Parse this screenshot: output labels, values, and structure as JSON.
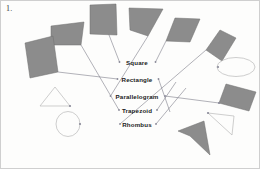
{
  "worksheet": {
    "question_number": "1.",
    "title_visible": false,
    "background_color": "#fdfdfc"
  },
  "palette": {
    "shape_fill": "#8c8c8c",
    "shape_stroke": "#6f6f6f",
    "outline_shape_stroke": "#b9b9b9",
    "connector_stroke": "#7e7e8a",
    "label_color": "#1b1b1b",
    "dot_color": "#8a8a99"
  },
  "labels": [
    {
      "id": "square",
      "text": "Square",
      "x": 137,
      "y": 62
    },
    {
      "id": "rectangle",
      "text": "Rectangle",
      "x": 137,
      "y": 79
    },
    {
      "id": "parallelogram",
      "text": "Parallelogram",
      "x": 137,
      "y": 96
    },
    {
      "id": "trapezoid",
      "text": "Trapezoid",
      "x": 137,
      "y": 110
    },
    {
      "id": "rhombus",
      "text": "Rhombus",
      "x": 137,
      "y": 124
    }
  ],
  "label_dots": [
    {
      "id": "square-left-dot",
      "x": 119.5,
      "y": 62
    },
    {
      "id": "square-right-dot",
      "x": 155.5,
      "y": 62
    },
    {
      "id": "rectangle-left-dot",
      "x": 117.5,
      "y": 79
    },
    {
      "id": "rectangle-right-dot",
      "x": 158.5,
      "y": 79
    },
    {
      "id": "parallelogram-left-dot",
      "x": 110.5,
      "y": 96
    },
    {
      "id": "parallelogram-right-dot",
      "x": 165.0,
      "y": 96
    },
    {
      "id": "trapezoid-left-dot",
      "x": 119.0,
      "y": 110
    },
    {
      "id": "trapezoid-right-dot",
      "x": 157.0,
      "y": 110
    },
    {
      "id": "rhombus-left-dot",
      "x": 120.0,
      "y": 124
    },
    {
      "id": "rhombus-right-dot",
      "x": 156.0,
      "y": 124
    }
  ],
  "filled_shapes": [
    {
      "id": "shape-square-top",
      "kind": "square",
      "points": "90,5 116,4 117,35 90,34"
    },
    {
      "id": "shape-trapezoid-topleft",
      "kind": "trapezoid",
      "points": "51,26 84,22 81,45 51,45"
    },
    {
      "id": "shape-rect-tilted-left",
      "kind": "rectangle",
      "points": "25,43 53,36 58,72 30,78"
    },
    {
      "id": "shape-trapezoid-topmid",
      "kind": "trapezoid",
      "points": "129,8 163,9 148,36 130,30"
    },
    {
      "id": "shape-parallelogram-top",
      "kind": "parallelogram",
      "points": "175,18 200,19 190,42 166,41"
    },
    {
      "id": "shape-rhombus-topright",
      "kind": "rhombus",
      "points": "220,30 236,38 222,61 206,50"
    },
    {
      "id": "shape-rect-tilted-right",
      "kind": "rectangle",
      "points": "226,84 256,92 249,111 219,103"
    },
    {
      "id": "shape-dart-bottom",
      "kind": "concave-arrow",
      "points": "204,121 210,155 190,136 178,131"
    }
  ],
  "outline_shapes": [
    {
      "id": "shape-triangle-left",
      "kind": "triangle",
      "points": "55,87 70,106 40,106"
    },
    {
      "id": "shape-circle-left",
      "kind": "circle",
      "cx": 68,
      "cy": 124,
      "rx": 12,
      "ry": 12.5
    },
    {
      "id": "shape-ellipse-right",
      "kind": "ellipse",
      "cx": 236,
      "cy": 67,
      "rx": 19,
      "ry": 9.5
    },
    {
      "id": "shape-triangle-right",
      "kind": "triangle",
      "points": "208,113 234,116 232,135"
    }
  ],
  "shape_dots": [
    {
      "id": "dot-triangle-left",
      "x": 70,
      "y": 106
    },
    {
      "id": "dot-circle-left",
      "x": 80,
      "y": 124
    },
    {
      "id": "dot-ellipse-right",
      "x": 218,
      "y": 67
    },
    {
      "id": "dot-triangle-right",
      "x": 208,
      "y": 113
    },
    {
      "id": "dot-rect-right",
      "x": 219,
      "y": 103
    }
  ],
  "connectors": [
    {
      "id": "connector-square-to-square-shape",
      "from": "square-left-dot",
      "path": "119.5,62 104,22 104,22"
    },
    {
      "id": "connector-square-to-trapezoid-left",
      "from": "trapezoid-left-dot",
      "path": "119,110 81,45"
    },
    {
      "id": "connector-rectangle-to-rect-left",
      "from": "rectangle-left-dot",
      "path": "117.5,79 58,72"
    },
    {
      "id": "connector-parallelogram-to-tzmid",
      "from": "parallelogram-left-dot",
      "path": "110.5,96 148,36"
    },
    {
      "id": "connector-rhombus-to-rhombus-right",
      "from": "rhombus-left-dot",
      "path": "120,124 206,50"
    },
    {
      "id": "connector-square-right-to-plgm",
      "from": "square-right-dot",
      "path": "155.5,62 166,41"
    },
    {
      "id": "connector-rectangle-right-down",
      "from": "rectangle-right-dot",
      "path": "158.5,79 170,112"
    },
    {
      "id": "connector-parallelogram-right-to-rect",
      "from": "parallelogram-right-dot",
      "path": "165,96 219,103"
    },
    {
      "id": "connector-trapezoid-right-up",
      "from": "trapezoid-right-dot",
      "path": "157,110 176,82"
    },
    {
      "id": "connector-rhombus-right-up",
      "from": "rhombus-right-dot",
      "path": "156,124 186,88"
    }
  ]
}
